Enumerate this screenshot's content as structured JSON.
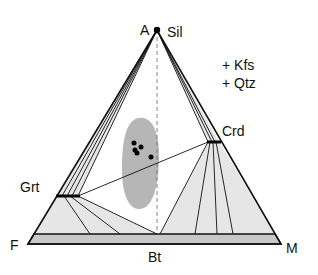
{
  "diagram": {
    "vertices": {
      "apex": "A",
      "left": "F",
      "right": "M"
    },
    "phases": {
      "apex_phase": "Sil",
      "right_phase": "Crd",
      "left_phase": "Grt",
      "base_phase": "Bt"
    },
    "extra_phases": [
      "+ Kfs",
      "+ Qtz"
    ],
    "colors": {
      "line": "#111111",
      "fill_light": "#e6e6e6",
      "band_fill": "#c8c8c8",
      "blob_fill": "#a9a9a9",
      "points": "#000000"
    },
    "data_points": [
      {
        "x": 134,
        "y": 143
      },
      {
        "x": 141,
        "y": 147
      },
      {
        "x": 135,
        "y": 150
      },
      {
        "x": 137,
        "y": 153
      },
      {
        "x": 151,
        "y": 157
      }
    ]
  }
}
